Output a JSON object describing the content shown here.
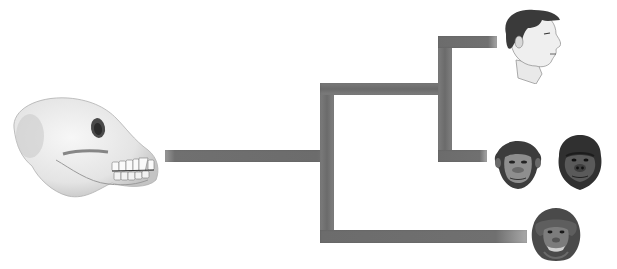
{
  "figure": {
    "type": "phylogenetic-tree",
    "caption_partial": "",
    "ancestor": {
      "name": "ancestral-ape-skull",
      "icon": "skull-icon"
    },
    "taxa": [
      {
        "name": "human",
        "icon": "human-head-icon"
      },
      {
        "name": "chimpanzee",
        "icon": "chimpanzee-face-icon"
      },
      {
        "name": "gorilla",
        "icon": "gorilla-face-icon"
      },
      {
        "name": "orangutan",
        "icon": "orangutan-face-icon"
      }
    ],
    "branch_color": "#6e6e6e",
    "background_color": "#ffffff"
  }
}
